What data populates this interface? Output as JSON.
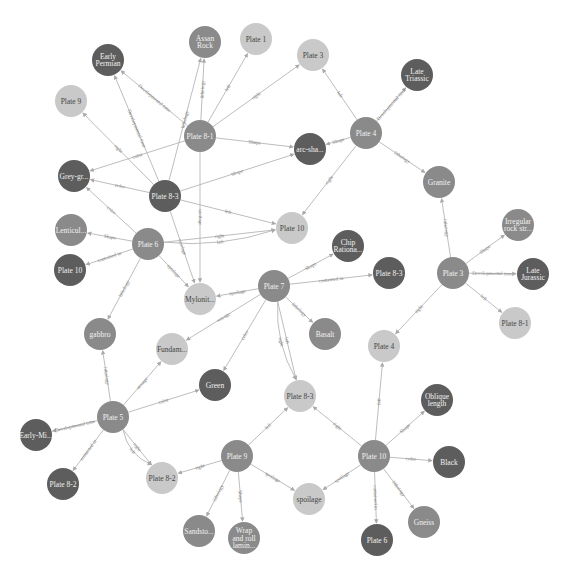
{
  "colors": {
    "dark": "#5d5d5d",
    "medium": "#8a8a8a",
    "light": "#c9c9c9",
    "text_on_dark": "#f2f2f2",
    "text_on_light": "#444444",
    "edge": "#b5b5b5"
  },
  "nodes": [
    {
      "id": "assan",
      "lines": [
        "Assan",
        "Rock"
      ],
      "x": 205,
      "y": 42,
      "tone": "medium"
    },
    {
      "id": "plate1",
      "lines": [
        "Plate 1"
      ],
      "x": 256,
      "y": 39,
      "tone": "light"
    },
    {
      "id": "earlyperm",
      "lines": [
        "Early",
        "Permian"
      ],
      "x": 108,
      "y": 60,
      "tone": "dark"
    },
    {
      "id": "plate3a",
      "lines": [
        "Plate 3"
      ],
      "x": 313,
      "y": 55,
      "tone": "light"
    },
    {
      "id": "latetri",
      "lines": [
        "Late",
        "Triassic"
      ],
      "x": 417,
      "y": 75,
      "tone": "dark"
    },
    {
      "id": "plate9a",
      "lines": [
        "Plate 9"
      ],
      "x": 71,
      "y": 101,
      "tone": "light"
    },
    {
      "id": "plate81a",
      "lines": [
        "Plate 8-1"
      ],
      "x": 200,
      "y": 136,
      "tone": "medium"
    },
    {
      "id": "arcsha",
      "lines": [
        "arc-sha..."
      ],
      "x": 310,
      "y": 149,
      "tone": "dark"
    },
    {
      "id": "plate4a",
      "lines": [
        "Plate 4"
      ],
      "x": 366,
      "y": 133,
      "tone": "medium"
    },
    {
      "id": "greygr",
      "lines": [
        "Grey-gr..."
      ],
      "x": 74,
      "y": 176,
      "tone": "dark"
    },
    {
      "id": "plate83a",
      "lines": [
        "Plate 8-3"
      ],
      "x": 165,
      "y": 196,
      "tone": "dark"
    },
    {
      "id": "granite",
      "lines": [
        "Granite"
      ],
      "x": 439,
      "y": 182,
      "tone": "medium"
    },
    {
      "id": "lenticul",
      "lines": [
        "Lenticul..."
      ],
      "x": 71,
      "y": 230,
      "tone": "medium"
    },
    {
      "id": "plate6a",
      "lines": [
        "Plate 6"
      ],
      "x": 148,
      "y": 244,
      "tone": "medium"
    },
    {
      "id": "plate10a",
      "lines": [
        "Plate 10"
      ],
      "x": 292,
      "y": 228,
      "tone": "light"
    },
    {
      "id": "chip",
      "lines": [
        "Chip",
        "Rationa..."
      ],
      "x": 348,
      "y": 246,
      "tone": "dark"
    },
    {
      "id": "irreg",
      "lines": [
        "Irregular",
        "rock str..."
      ],
      "x": 518,
      "y": 225,
      "tone": "medium"
    },
    {
      "id": "plate10b",
      "lines": [
        "Plate 10"
      ],
      "x": 70,
      "y": 270,
      "tone": "dark"
    },
    {
      "id": "plate3b",
      "lines": [
        "Plate 3"
      ],
      "x": 453,
      "y": 273,
      "tone": "medium"
    },
    {
      "id": "latejur",
      "lines": [
        "Late",
        "Jurassic"
      ],
      "x": 533,
      "y": 274,
      "tone": "dark"
    },
    {
      "id": "plate83b",
      "lines": [
        "Plate 8-3"
      ],
      "x": 389,
      "y": 273,
      "tone": "dark"
    },
    {
      "id": "plate7",
      "lines": [
        "Plate 7"
      ],
      "x": 274,
      "y": 286,
      "tone": "medium"
    },
    {
      "id": "mylonit",
      "lines": [
        "Mylonit..."
      ],
      "x": 200,
      "y": 299,
      "tone": "light"
    },
    {
      "id": "plate81b",
      "lines": [
        "Plate 8-1"
      ],
      "x": 515,
      "y": 323,
      "tone": "light"
    },
    {
      "id": "gabbro",
      "lines": [
        "gabbro"
      ],
      "x": 100,
      "y": 334,
      "tone": "medium"
    },
    {
      "id": "fundam",
      "lines": [
        "Fundam..."
      ],
      "x": 172,
      "y": 349,
      "tone": "light"
    },
    {
      "id": "basalt",
      "lines": [
        "Basalt"
      ],
      "x": 325,
      "y": 334,
      "tone": "medium"
    },
    {
      "id": "plate4b",
      "lines": [
        "Plate 4"
      ],
      "x": 384,
      "y": 346,
      "tone": "light"
    },
    {
      "id": "green",
      "lines": [
        "Green"
      ],
      "x": 215,
      "y": 385,
      "tone": "dark"
    },
    {
      "id": "plate83c",
      "lines": [
        "Plate 8-3"
      ],
      "x": 300,
      "y": 396,
      "tone": "light"
    },
    {
      "id": "oblique",
      "lines": [
        "Oblique",
        "length"
      ],
      "x": 437,
      "y": 400,
      "tone": "dark"
    },
    {
      "id": "plate5",
      "lines": [
        "Plate 5"
      ],
      "x": 113,
      "y": 417,
      "tone": "medium"
    },
    {
      "id": "earlymi",
      "lines": [
        "Early-Mi..."
      ],
      "x": 36,
      "y": 435,
      "tone": "dark"
    },
    {
      "id": "plate10c",
      "lines": [
        "Plate 10"
      ],
      "x": 374,
      "y": 456,
      "tone": "medium"
    },
    {
      "id": "black",
      "lines": [
        "Black"
      ],
      "x": 449,
      "y": 462,
      "tone": "dark"
    },
    {
      "id": "plate9b",
      "lines": [
        "Plate 9"
      ],
      "x": 237,
      "y": 456,
      "tone": "medium"
    },
    {
      "id": "plate82a",
      "lines": [
        "Plate 8-2"
      ],
      "x": 63,
      "y": 484,
      "tone": "dark"
    },
    {
      "id": "plate82b",
      "lines": [
        "Plate 8-2"
      ],
      "x": 162,
      "y": 478,
      "tone": "light"
    },
    {
      "id": "spoilage",
      "lines": [
        "spoilage"
      ],
      "x": 309,
      "y": 499,
      "tone": "light"
    },
    {
      "id": "gneiss",
      "lines": [
        "Gneiss"
      ],
      "x": 424,
      "y": 522,
      "tone": "medium"
    },
    {
      "id": "sandsto",
      "lines": [
        "Sandsto..."
      ],
      "x": 199,
      "y": 531,
      "tone": "medium"
    },
    {
      "id": "wrap",
      "lines": [
        "Wrap",
        "and roll",
        "lamin..."
      ],
      "x": 244,
      "y": 538,
      "tone": "medium"
    },
    {
      "id": "plate6b",
      "lines": [
        "Plate 6"
      ],
      "x": 377,
      "y": 540,
      "tone": "dark"
    }
  ],
  "edges": [
    {
      "from": "plate81a",
      "to": "assan",
      "label": "lithology"
    },
    {
      "from": "plate81a",
      "to": "plate1",
      "label": "left"
    },
    {
      "from": "plate81a",
      "to": "plate3a",
      "label": "right"
    },
    {
      "from": "plate81a",
      "to": "earlyperm",
      "label": "Developmental time"
    },
    {
      "from": "plate81a",
      "to": "arcsha",
      "label": "Shape"
    },
    {
      "from": "plate81a",
      "to": "greygr",
      "label": "color"
    },
    {
      "from": "plate81a",
      "to": "mylonit",
      "label": "spoilage"
    },
    {
      "from": "plate83a",
      "to": "assan",
      "label": "lithology"
    },
    {
      "from": "plate83a",
      "to": "earlyperm",
      "label": "Developmental time"
    },
    {
      "from": "plate83a",
      "to": "plate9a",
      "label": "right"
    },
    {
      "from": "plate83a",
      "to": "greygr",
      "label": "color"
    },
    {
      "from": "plate83a",
      "to": "arcsha",
      "label": "Shape"
    },
    {
      "from": "plate83a",
      "to": "plate10a",
      "label": "left"
    },
    {
      "from": "plate83a",
      "to": "mylonit",
      "label": "spoilage"
    },
    {
      "from": "plate4a",
      "to": "latetri",
      "label": "Developmental time"
    },
    {
      "from": "plate4a",
      "to": "plate3a",
      "label": "left"
    },
    {
      "from": "plate4a",
      "to": "arcsha",
      "label": "Shape"
    },
    {
      "from": "plate4a",
      "to": "granite",
      "label": "lithology"
    },
    {
      "from": "plate4a",
      "to": "plate10a",
      "label": "right"
    },
    {
      "from": "plate6a",
      "to": "greygr",
      "label": "color"
    },
    {
      "from": "plate6a",
      "to": "lenticul",
      "label": "Shape"
    },
    {
      "from": "plate6a",
      "to": "plate10b",
      "label": "contained in"
    },
    {
      "from": "plate6a",
      "to": "plate10a",
      "label": "right"
    },
    {
      "from": "plate6a",
      "to": "plate10a",
      "label": "left"
    },
    {
      "from": "plate6a",
      "to": "mylonit",
      "label": "spoilage"
    },
    {
      "from": "plate6a",
      "to": "gabbro",
      "label": "lithology"
    },
    {
      "from": "plate3b",
      "to": "granite",
      "label": "lithology"
    },
    {
      "from": "plate3b",
      "to": "irreg",
      "label": "Shape"
    },
    {
      "from": "plate3b",
      "to": "latejur",
      "label": "Developmental time"
    },
    {
      "from": "plate3b",
      "to": "plate81b",
      "label": "left"
    },
    {
      "from": "plate3b",
      "to": "plate4b",
      "label": "right"
    },
    {
      "from": "plate7",
      "to": "chip",
      "label": "Shape"
    },
    {
      "from": "plate7",
      "to": "plate83b",
      "label": "contained in"
    },
    {
      "from": "plate7",
      "to": "mylonit",
      "label": "spoilage"
    },
    {
      "from": "plate7",
      "to": "basalt",
      "label": "lithology"
    },
    {
      "from": "plate7",
      "to": "fundam",
      "label": "storage"
    },
    {
      "from": "plate7",
      "to": "green",
      "label": "color"
    },
    {
      "from": "plate7",
      "to": "plate83c",
      "label": "left"
    },
    {
      "from": "plate7",
      "to": "plate83c",
      "label": "right"
    },
    {
      "from": "plate5",
      "to": "gabbro",
      "label": "lithology"
    },
    {
      "from": "plate5",
      "to": "fundam",
      "label": "storage"
    },
    {
      "from": "plate5",
      "to": "green",
      "label": "color"
    },
    {
      "from": "plate5",
      "to": "earlymi",
      "label": "Developmental time"
    },
    {
      "from": "plate5",
      "to": "plate82a",
      "label": "contained in"
    },
    {
      "from": "plate5",
      "to": "plate82b",
      "label": "right"
    },
    {
      "from": "plate5",
      "to": "plate82b",
      "label": "left"
    },
    {
      "from": "plate9b",
      "to": "plate83c",
      "label": "left"
    },
    {
      "from": "plate9b",
      "to": "plate82b",
      "label": "right"
    },
    {
      "from": "plate9b",
      "to": "spoilage",
      "label": "spoilage"
    },
    {
      "from": "plate9b",
      "to": "sandsto",
      "label": "lithology"
    },
    {
      "from": "plate9b",
      "to": "wrap",
      "label": "Shape"
    },
    {
      "from": "plate10c",
      "to": "plate83c",
      "label": "right"
    },
    {
      "from": "plate10c",
      "to": "plate4b",
      "label": "left"
    },
    {
      "from": "plate10c",
      "to": "oblique",
      "label": "Shape"
    },
    {
      "from": "plate10c",
      "to": "black",
      "label": "color"
    },
    {
      "from": "plate10c",
      "to": "spoilage",
      "label": "spoilage"
    },
    {
      "from": "plate10c",
      "to": "plate6b",
      "label": "contained in"
    },
    {
      "from": "plate10c",
      "to": "gneiss",
      "label": "lithology"
    }
  ],
  "caption": ""
}
